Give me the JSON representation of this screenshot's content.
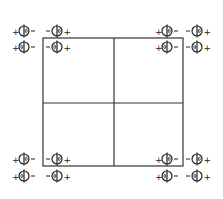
{
  "diagram": {
    "square": {
      "x": 43,
      "y": 38,
      "width": 140,
      "height": 128,
      "cross_x": 114,
      "cross_y": 103
    },
    "line_color": "#333333",
    "symbol_color": "#222222",
    "corners": [
      {
        "name": "top-left",
        "rows": [
          {
            "y": 31,
            "left_sign": "+",
            "right_sign": "+",
            "mid_signs": [
              "-",
              "-"
            ],
            "symbols": [
              {
                "cx": 24,
                "mark": "right"
              },
              {
                "cx": 57,
                "mark": "right"
              }
            ]
          },
          {
            "y": 47,
            "left_sign": "+",
            "right_sign": "+",
            "mid_signs": [
              "-",
              "-"
            ],
            "symbols": [
              {
                "cx": 24,
                "mark": "left"
              },
              {
                "cx": 57,
                "mark": "left"
              }
            ]
          }
        ]
      },
      {
        "name": "top-right",
        "rows": [
          {
            "y": 31,
            "left_sign": "+",
            "right_sign": "+",
            "mid_signs": [
              "-",
              "-"
            ],
            "symbols": [
              {
                "cx": 167,
                "mark": "right"
              },
              {
                "cx": 197,
                "mark": "right"
              }
            ]
          },
          {
            "y": 47,
            "left_sign": "+",
            "right_sign": "+",
            "mid_signs": [
              "-",
              "-"
            ],
            "symbols": [
              {
                "cx": 167,
                "mark": "left"
              },
              {
                "cx": 197,
                "mark": "left"
              }
            ]
          }
        ]
      },
      {
        "name": "bottom-left",
        "rows": [
          {
            "y": 159,
            "left_sign": "+",
            "right_sign": "+",
            "mid_signs": [
              "-",
              "-"
            ],
            "symbols": [
              {
                "cx": 24,
                "mark": "right"
              },
              {
                "cx": 57,
                "mark": "right"
              }
            ]
          },
          {
            "y": 176,
            "left_sign": "+",
            "right_sign": "+",
            "mid_signs": [
              "-",
              "-"
            ],
            "symbols": [
              {
                "cx": 24,
                "mark": "left"
              },
              {
                "cx": 57,
                "mark": "left"
              }
            ]
          }
        ]
      },
      {
        "name": "bottom-right",
        "rows": [
          {
            "y": 159,
            "left_sign": "+",
            "right_sign": "+",
            "mid_signs": [
              "-",
              "-"
            ],
            "symbols": [
              {
                "cx": 167,
                "mark": "right"
              },
              {
                "cx": 197,
                "mark": "right"
              }
            ]
          },
          {
            "y": 176,
            "left_sign": "+",
            "right_sign": "+",
            "mid_signs": [
              "-",
              "-"
            ],
            "symbols": [
              {
                "cx": 167,
                "mark": "left"
              },
              {
                "cx": 197,
                "mark": "left"
              }
            ]
          }
        ]
      }
    ]
  }
}
